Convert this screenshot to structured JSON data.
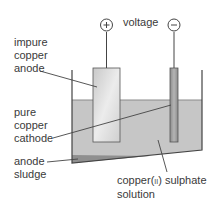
{
  "diagram": {
    "terminals": {
      "positive": "+",
      "negative": "−",
      "voltage_label": "voltage"
    },
    "labels": {
      "anode": [
        "impure",
        "copper",
        "anode"
      ],
      "cathode": [
        "pure",
        "copper",
        "cathode"
      ],
      "sludge": [
        "anode",
        "sludge"
      ],
      "solution_line1": "copper(",
      "solution_roman": "II",
      "solution_line1_end": ") sulphate",
      "solution_line2": "solution"
    },
    "colors": {
      "solution": "#c4c4c4",
      "anode": "#dedede",
      "cathode": "#9a9a9a",
      "sludge": "#8a8a8a",
      "lines": "#444444"
    }
  }
}
